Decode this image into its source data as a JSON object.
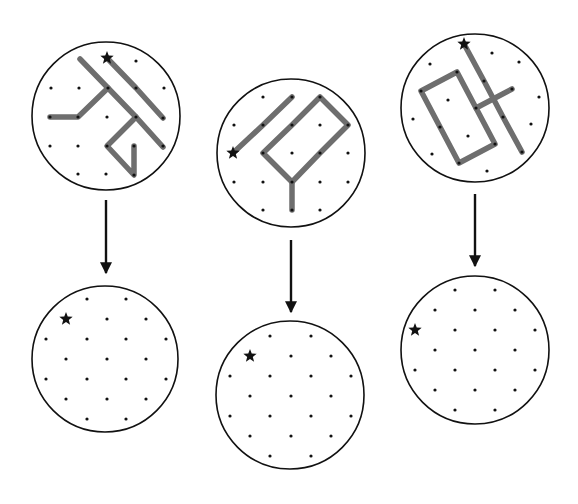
{
  "figure": {
    "width": 578,
    "height": 504,
    "colors": {
      "background": "#ffffff",
      "outline": "#111111",
      "path": "#6e6e6e",
      "dot": "#111111",
      "star": "#111111"
    },
    "icons": {
      "start_marker": "star-icon",
      "arrow": "arrow-down-icon"
    },
    "columns": [
      {
        "name": "column-1",
        "top_circle": {
          "cx": 106,
          "cy": 116,
          "r": 74,
          "star": [
            107,
            58
          ],
          "dots": [
            [
              136,
              61
            ],
            [
              51,
              88
            ],
            [
              79,
              88
            ],
            [
              108,
              88
            ],
            [
              136,
              88
            ],
            [
              164,
              88
            ],
            [
              50,
              117
            ],
            [
              78,
              117
            ],
            [
              107,
              117
            ],
            [
              136,
              117
            ],
            [
              163,
              118
            ],
            [
              50,
              146
            ],
            [
              78,
              146
            ],
            [
              107,
              146
            ],
            [
              134,
              146
            ],
            [
              163,
              146
            ],
            [
              78,
              174
            ],
            [
              106,
              174
            ],
            [
              134,
              175
            ]
          ],
          "paths": [
            [
              [
                80,
                59
              ],
              [
                108,
                88
              ],
              [
                136,
                117
              ],
              [
                163,
                147
              ]
            ],
            [
              [
                107,
                58
              ],
              [
                136,
                88
              ],
              [
                163,
                118
              ]
            ],
            [
              [
                50,
                117
              ],
              [
                78,
                117
              ],
              [
                108,
                88
              ]
            ],
            [
              [
                136,
                117
              ],
              [
                107,
                146
              ],
              [
                134,
                175
              ],
              [
                134,
                146
              ]
            ]
          ]
        },
        "arrow": {
          "x": 106,
          "y1": 200,
          "y2": 273
        },
        "bottom_circle": {
          "cx": 105,
          "cy": 359,
          "r": 73,
          "star": [
            66,
            319
          ],
          "dots": [
            [
              87,
              299
            ],
            [
              126,
              299
            ],
            [
              107,
              319
            ],
            [
              146,
              319
            ],
            [
              46,
              339
            ],
            [
              87,
              339
            ],
            [
              126,
              339
            ],
            [
              166,
              339
            ],
            [
              66,
              359
            ],
            [
              107,
              359
            ],
            [
              146,
              359
            ],
            [
              46,
              379
            ],
            [
              87,
              379
            ],
            [
              126,
              379
            ],
            [
              166,
              379
            ],
            [
              66,
              399
            ],
            [
              107,
              399
            ],
            [
              146,
              399
            ],
            [
              87,
              419
            ],
            [
              126,
              419
            ]
          ]
        }
      },
      {
        "name": "column-2",
        "top_circle": {
          "cx": 291,
          "cy": 153,
          "r": 74,
          "star": [
            233,
            153
          ],
          "dots": [
            [
              263,
              97
            ],
            [
              292,
              97
            ],
            [
              320,
              97
            ],
            [
              234,
              125
            ],
            [
              263,
              125
            ],
            [
              292,
              125
            ],
            [
              320,
              125
            ],
            [
              348,
              125
            ],
            [
              263,
              153
            ],
            [
              292,
              153
            ],
            [
              320,
              153
            ],
            [
              348,
              153
            ],
            [
              234,
              182
            ],
            [
              263,
              182
            ],
            [
              292,
              182
            ],
            [
              320,
              182
            ],
            [
              348,
              182
            ],
            [
              263,
              210
            ],
            [
              292,
              210
            ],
            [
              320,
              210
            ]
          ],
          "paths": [
            [
              [
                233,
                153
              ],
              [
                263,
                125
              ],
              [
                292,
                97
              ]
            ],
            [
              [
                263,
                153
              ],
              [
                292,
                125
              ],
              [
                320,
                97
              ],
              [
                348,
                125
              ],
              [
                320,
                153
              ],
              [
                292,
                182
              ],
              [
                263,
                153
              ]
            ],
            [
              [
                292,
                182
              ],
              [
                292,
                210
              ]
            ]
          ]
        },
        "arrow": {
          "x": 291,
          "y1": 240,
          "y2": 312
        },
        "bottom_circle": {
          "cx": 290,
          "cy": 395,
          "r": 74,
          "star": [
            250,
            356
          ],
          "dots": [
            [
              270,
              336
            ],
            [
              311,
              336
            ],
            [
              291,
              356
            ],
            [
              331,
              356
            ],
            [
              230,
              376
            ],
            [
              270,
              376
            ],
            [
              311,
              376
            ],
            [
              351,
              376
            ],
            [
              250,
              396
            ],
            [
              291,
              396
            ],
            [
              331,
              396
            ],
            [
              230,
              416
            ],
            [
              270,
              416
            ],
            [
              311,
              416
            ],
            [
              351,
              416
            ],
            [
              250,
              436
            ],
            [
              291,
              436
            ],
            [
              331,
              436
            ],
            [
              270,
              456
            ],
            [
              311,
              456
            ]
          ]
        }
      },
      {
        "name": "column-3",
        "top_circle": {
          "cx": 475,
          "cy": 108,
          "r": 74,
          "star": [
            464,
            44
          ],
          "dots": [
            [
              492,
              53
            ],
            [
              430,
              64
            ],
            [
              519,
              62
            ],
            [
              457,
              72
            ],
            [
              484,
              81
            ],
            [
              421,
              91
            ],
            [
              512,
              89
            ],
            [
              448,
              100
            ],
            [
              539,
              97
            ],
            [
              476,
              108
            ],
            [
              503,
              117
            ],
            [
              413,
              119
            ],
            [
              440,
              127
            ],
            [
              531,
              124
            ],
            [
              468,
              136
            ],
            [
              495,
              144
            ],
            [
              522,
              152
            ],
            [
              432,
              154
            ],
            [
              459,
              163
            ],
            [
              487,
              171
            ]
          ],
          "paths": [
            [
              [
                464,
                44
              ],
              [
                484,
                81
              ],
              [
                503,
                117
              ],
              [
                522,
                152
              ]
            ],
            [
              [
                457,
                72
              ],
              [
                421,
                91
              ],
              [
                459,
                163
              ],
              [
                495,
                144
              ],
              [
                457,
                72
              ]
            ],
            [
              [
                476,
                108
              ],
              [
                512,
                89
              ]
            ]
          ]
        },
        "arrow": {
          "x": 475,
          "y1": 194,
          "y2": 266
        },
        "bottom_circle": {
          "cx": 475,
          "cy": 350,
          "r": 74,
          "star": [
            415,
            330
          ],
          "dots": [
            [
              455,
              290
            ],
            [
              495,
              290
            ],
            [
              435,
              310
            ],
            [
              475,
              310
            ],
            [
              515,
              310
            ],
            [
              455,
              330
            ],
            [
              495,
              330
            ],
            [
              535,
              330
            ],
            [
              435,
              350
            ],
            [
              475,
              350
            ],
            [
              515,
              350
            ],
            [
              415,
              370
            ],
            [
              455,
              370
            ],
            [
              495,
              370
            ],
            [
              535,
              370
            ],
            [
              435,
              390
            ],
            [
              475,
              390
            ],
            [
              515,
              390
            ],
            [
              455,
              410
            ],
            [
              495,
              410
            ]
          ]
        }
      }
    ]
  }
}
